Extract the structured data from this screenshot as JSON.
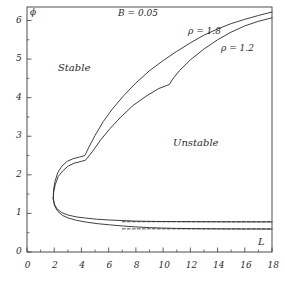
{
  "figure": {
    "title": "B = 0.05",
    "phi_symbol": "ϕ",
    "background_color": "#ffffff",
    "line_color": "#2a2a2a",
    "frame_color": "#3a3a3a"
  },
  "annotations": {
    "stable": "Stable",
    "unstable": "Unstable",
    "rho_upper": "ρ = 1.8",
    "rho_lower": "ρ = 1.2"
  },
  "axes": {
    "x_name": "L",
    "y_name": "ϕ",
    "x_ticks": [
      "0",
      "2",
      "4",
      "6",
      "8",
      "10",
      "12",
      "14",
      "16",
      "18"
    ],
    "y_ticks": [
      "0",
      "1",
      "2",
      "3",
      "4",
      "5",
      "6"
    ]
  },
  "chart_data": {
    "type": "line",
    "title": "B = 0.05",
    "xlabel": "L",
    "ylabel": "ϕ",
    "xlim": [
      0,
      18
    ],
    "ylim": [
      0,
      6.35
    ],
    "x_ticks": [
      0,
      2,
      4,
      6,
      8,
      10,
      12,
      14,
      16,
      18
    ],
    "x_minor_ticks": [
      1,
      3,
      5,
      7,
      9,
      11,
      13,
      15,
      17
    ],
    "y_ticks": [
      0,
      1,
      2,
      3,
      4,
      5,
      6
    ],
    "y_minor_ticks": [
      0.5,
      1.5,
      2.5,
      3.5,
      4.5,
      5.5
    ],
    "grid": false,
    "legend": "inline-annotations",
    "regions": [
      {
        "name": "Stable",
        "x": 4.0,
        "y": 5.0
      },
      {
        "name": "Unstable",
        "x": 12.2,
        "y": 2.95
      }
    ],
    "series": [
      {
        "name": "ρ = 1.8",
        "style": "solid",
        "branch": "upper",
        "points": [
          [
            1.93,
            1.4
          ],
          [
            1.95,
            1.6
          ],
          [
            2.05,
            1.82
          ],
          [
            2.25,
            2.05
          ],
          [
            2.55,
            2.22
          ],
          [
            2.95,
            2.35
          ],
          [
            3.4,
            2.42
          ],
          [
            3.85,
            2.46
          ],
          [
            4.25,
            2.5
          ],
          [
            4.55,
            2.72
          ],
          [
            5.0,
            3.02
          ],
          [
            5.6,
            3.38
          ],
          [
            6.3,
            3.72
          ],
          [
            7.1,
            4.05
          ],
          [
            8.0,
            4.38
          ],
          [
            9.0,
            4.7
          ],
          [
            10.0,
            4.96
          ],
          [
            11.0,
            5.2
          ],
          [
            12.0,
            5.42
          ],
          [
            13.0,
            5.62
          ],
          [
            14.0,
            5.78
          ],
          [
            15.0,
            5.92
          ],
          [
            16.0,
            6.03
          ],
          [
            17.0,
            6.13
          ],
          [
            18.0,
            6.22
          ]
        ]
      },
      {
        "name": "ρ = 1.2",
        "style": "solid",
        "branch": "upper",
        "points": [
          [
            1.93,
            1.38
          ],
          [
            1.96,
            1.55
          ],
          [
            2.08,
            1.75
          ],
          [
            2.3,
            1.96
          ],
          [
            2.62,
            2.1
          ],
          [
            3.0,
            2.22
          ],
          [
            3.45,
            2.3
          ],
          [
            3.9,
            2.34
          ],
          [
            4.3,
            2.38
          ],
          [
            4.8,
            2.6
          ],
          [
            5.4,
            2.9
          ],
          [
            6.1,
            3.2
          ],
          [
            6.9,
            3.5
          ],
          [
            7.8,
            3.8
          ],
          [
            8.8,
            4.05
          ],
          [
            9.7,
            4.24
          ],
          [
            10.45,
            4.34
          ],
          [
            10.7,
            4.48
          ],
          [
            11.2,
            4.7
          ],
          [
            12.0,
            4.98
          ],
          [
            13.0,
            5.26
          ],
          [
            14.0,
            5.5
          ],
          [
            15.0,
            5.7
          ],
          [
            16.0,
            5.86
          ],
          [
            17.0,
            5.98
          ],
          [
            18.0,
            6.07
          ]
        ]
      },
      {
        "name": "ρ = 1.8",
        "style": "solid",
        "branch": "lower",
        "points": [
          [
            1.93,
            1.4
          ],
          [
            2.0,
            1.25
          ],
          [
            2.2,
            1.12
          ],
          [
            2.55,
            1.02
          ],
          [
            3.0,
            0.96
          ],
          [
            3.6,
            0.91
          ],
          [
            4.3,
            0.88
          ],
          [
            5.1,
            0.85
          ],
          [
            6.0,
            0.83
          ],
          [
            7.0,
            0.815
          ],
          [
            8.0,
            0.8
          ],
          [
            9.0,
            0.795
          ],
          [
            10.0,
            0.79
          ],
          [
            11.0,
            0.788
          ],
          [
            12.0,
            0.786
          ],
          [
            13.0,
            0.784
          ],
          [
            14.0,
            0.782
          ],
          [
            15.0,
            0.781
          ],
          [
            16.0,
            0.78
          ],
          [
            17.0,
            0.779
          ],
          [
            18.0,
            0.778
          ]
        ]
      },
      {
        "name": "ρ = 1.2",
        "style": "solid",
        "branch": "lower",
        "points": [
          [
            1.93,
            1.38
          ],
          [
            2.02,
            1.2
          ],
          [
            2.25,
            1.06
          ],
          [
            2.6,
            0.95
          ],
          [
            3.05,
            0.88
          ],
          [
            3.65,
            0.82
          ],
          [
            4.35,
            0.775
          ],
          [
            5.15,
            0.735
          ],
          [
            6.05,
            0.705
          ],
          [
            7.0,
            0.675
          ],
          [
            8.0,
            0.65
          ],
          [
            9.0,
            0.632
          ],
          [
            10.0,
            0.62
          ],
          [
            11.0,
            0.612
          ],
          [
            12.0,
            0.607
          ],
          [
            13.0,
            0.603
          ],
          [
            14.0,
            0.6
          ],
          [
            15.0,
            0.598
          ],
          [
            16.0,
            0.596
          ],
          [
            17.0,
            0.595
          ],
          [
            18.0,
            0.594
          ]
        ]
      },
      {
        "name": "asymptote-upper",
        "style": "dashed",
        "branch": "asymptote",
        "points": [
          [
            7.0,
            0.785
          ],
          [
            18.0,
            0.785
          ]
        ]
      },
      {
        "name": "asymptote-lower",
        "style": "dashed",
        "branch": "asymptote",
        "points": [
          [
            7.0,
            0.6
          ],
          [
            18.0,
            0.6
          ]
        ]
      }
    ]
  }
}
